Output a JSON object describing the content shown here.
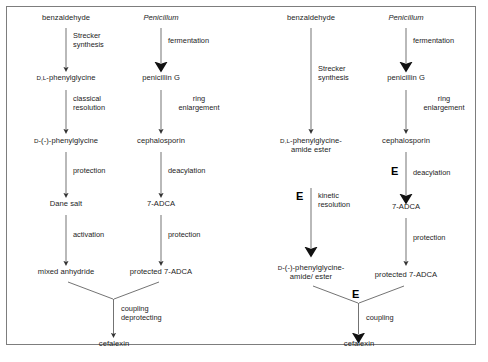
{
  "diagram": {
    "colors": {
      "frame": "#7d7d7d",
      "text": "#1c1c1c",
      "arrow": "#555555",
      "bold_marker": "#000000"
    },
    "panels": [
      {
        "id": "chemical-route",
        "name": "chemical route",
        "nodes": {
          "benzaldehyde": "benzaldehyde",
          "penicillum": "Penicillum",
          "dl_phenylglycine_d": "D",
          "dl_phenylglycine_l": ",L",
          "dl_phenylglycine_rest": "-phenylglycine",
          "penicillin_g": "penicillin G",
          "d_phenylglycine_d": "D",
          "d_phenylglycine_rest": "-(-)-phenylglycine",
          "cephalosporin": "cephalosporin",
          "dane_salt": "Dane salt",
          "adca": "7-ADCA",
          "mixed_anhydride": "mixed anhydride",
          "protected_adca": "protected 7-ADCA",
          "cefalexin": "cefalexin"
        },
        "steps": {
          "strecker_line1": "Strecker",
          "strecker_line2": "synthesis",
          "fermentation": "fermentation",
          "classical_line1": "classical",
          "classical_line2": "resolution",
          "ring_line1": "ring",
          "ring_line2": "enlargement",
          "protection": "protection",
          "deacylation": "deacylation",
          "activation": "activation",
          "protection2": "protection",
          "coupling_line1": "coupling",
          "coupling_line2": "deprotecting"
        }
      },
      {
        "id": "enzymatic-route",
        "name": "enzymatic route",
        "nodes": {
          "benzaldehyde": "benzaldehyde",
          "penicillum": "Penicillum",
          "dl_amide_d": "D",
          "dl_amide_l": ",L",
          "dl_amide_rest": "-phenylglycine-",
          "dl_amide_line2": "amide ester",
          "penicillin_g": "penicillin G",
          "cephalosporin": "cephalosporin",
          "adca": "7-ADCA",
          "d_amide_d": "D",
          "d_amide_rest": "-(-)-phenylglycine-",
          "d_amide_line2": "amide/ ester",
          "protected_adca": "protected 7-ADCA",
          "cefalexin": "cefalexin"
        },
        "steps": {
          "strecker_line1": "Strecker",
          "strecker_line2": "synthesis",
          "fermentation": "fermentation",
          "ring_line1": "ring",
          "ring_line2": "enlargement",
          "deacylation": "deacylation",
          "kinetic_line1": "kinetic",
          "kinetic_line2": "resolution",
          "protection": "protection",
          "coupling": "coupling"
        },
        "enzyme_markers": {
          "deacylation": "E",
          "kinetic_resolution": "E",
          "coupling": "E"
        }
      }
    ]
  }
}
